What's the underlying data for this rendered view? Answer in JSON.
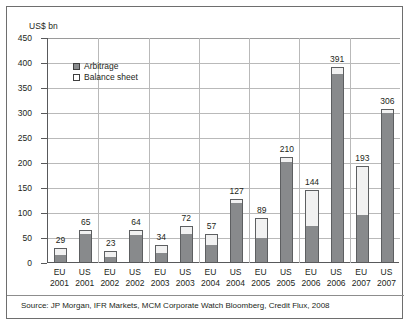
{
  "chart_data": {
    "type": "bar",
    "subtype": "stacked-vertical",
    "title": "",
    "xlabel": "",
    "ylabel": "US$ bn",
    "ylim": [
      0,
      450
    ],
    "ytick_step": 50,
    "yticks": [
      "0",
      "50",
      "100",
      "150",
      "200",
      "250",
      "300",
      "350",
      "400",
      "450"
    ],
    "grid": "horizontal-and-vertical",
    "legend_position": "top-left-inside",
    "categories": [
      "EU 2001",
      "US 2001",
      "EU 2002",
      "US 2002",
      "EU 2003",
      "US 2003",
      "EU 2004",
      "US 2004",
      "EU 2005",
      "US 2005",
      "EU 2006",
      "US 2006",
      "EU 2007",
      "US 2007"
    ],
    "category_regions": [
      "EU",
      "US",
      "EU",
      "US",
      "EU",
      "US",
      "EU",
      "US",
      "EU",
      "US",
      "EU",
      "US",
      "EU",
      "US"
    ],
    "category_years": [
      "2001",
      "2001",
      "2002",
      "2002",
      "2003",
      "2003",
      "2004",
      "2004",
      "2005",
      "2005",
      "2006",
      "2006",
      "2007",
      "2007"
    ],
    "series": [
      {
        "name": "Arbitrage",
        "color": "#888a8c",
        "values": [
          15,
          57,
          10,
          55,
          19,
          57,
          35,
          119,
          48,
          201,
          73,
          376,
          95,
          299
        ]
      },
      {
        "name": "Balance sheet",
        "color": "#f1f1f1",
        "values": [
          14,
          8,
          13,
          9,
          15,
          15,
          22,
          8,
          41,
          9,
          71,
          15,
          98,
          7
        ]
      }
    ],
    "totals": [
      29,
      65,
      23,
      64,
      34,
      72,
      57,
      127,
      89,
      210,
      144,
      391,
      193,
      306
    ],
    "data_labels": [
      "29",
      "65",
      "23",
      "64",
      "34",
      "72",
      "57",
      "127",
      "89",
      "210",
      "144",
      "391",
      "193",
      "306"
    ],
    "source": "Source: JP Morgan, IFR Markets, MCM Corporate Watch Bloomberg, Credit Flux, 2008"
  },
  "legend": {
    "items": [
      {
        "label": "Arbitrage"
      },
      {
        "label": "Balance sheet"
      }
    ]
  }
}
